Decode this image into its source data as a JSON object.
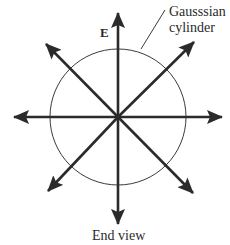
{
  "diagram": {
    "title": "End view",
    "field_label": "E",
    "surface_label_line1": "Gausssian",
    "surface_label_line2": "cylinder",
    "colors": {
      "arrow": "#2b2b2b",
      "circle": "#3a3a3a",
      "text": "#2a2a2a",
      "background": "#ffffff"
    },
    "center": [
      118,
      117
    ],
    "circle_radius": 68,
    "arrows": [
      {
        "direction": "up",
        "tip": [
          118,
          13
        ]
      },
      {
        "direction": "down",
        "tip": [
          118,
          224
        ]
      },
      {
        "direction": "left",
        "tip": [
          14,
          117
        ]
      },
      {
        "direction": "right",
        "tip": [
          222,
          117
        ]
      },
      {
        "direction": "up-left",
        "tip": [
          46,
          44
        ]
      },
      {
        "direction": "up-right",
        "tip": [
          194,
          42
        ]
      },
      {
        "direction": "down-left",
        "tip": [
          48,
          191
        ]
      },
      {
        "direction": "down-right",
        "tip": [
          193,
          193
        ]
      }
    ],
    "leader_line": {
      "from": [
        141,
        49
      ],
      "to": [
        165,
        10
      ]
    }
  }
}
